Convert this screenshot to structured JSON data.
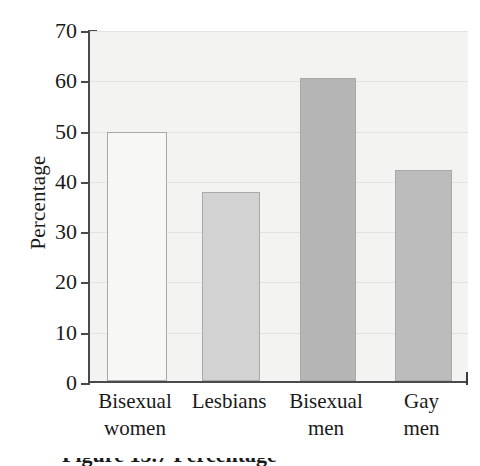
{
  "chart_data": {
    "type": "bar",
    "title": "",
    "xlabel": "",
    "ylabel": "Percentage",
    "ylim": [
      0,
      70
    ],
    "ytick_step": 10,
    "grid": true,
    "legend": "none",
    "categories": [
      "Bisexual women",
      "Lesbians",
      "Bisexual men",
      "Gay men"
    ],
    "category_lines": [
      [
        "Bisexual",
        "women"
      ],
      [
        "Lesbians",
        ""
      ],
      [
        "Bisexual",
        "men"
      ],
      [
        "Gay",
        "men"
      ]
    ],
    "values": [
      49.5,
      37.5,
      60.3,
      42.0
    ],
    "ytick_labels": [
      "70",
      "60",
      "50",
      "40",
      "30",
      "20",
      "10",
      "0"
    ],
    "ytick_values": [
      70,
      60,
      50,
      40,
      30,
      20,
      10,
      0
    ],
    "bar_colors": [
      "#f7f7f6",
      "#d2d2d2",
      "#b5b5b5",
      "#bcbcbc"
    ],
    "bar_border_color": "#a9a9a9",
    "plot_background": "#f3f3f1",
    "axis_color": "#4a4a4a",
    "gridline_color": "#e2e2e0"
  },
  "caption": {
    "text": "Figure 15.7  Percentage"
  }
}
